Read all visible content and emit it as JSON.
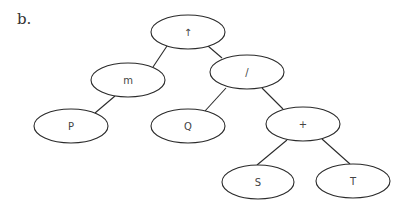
{
  "label": "b.",
  "colors": {
    "stroke": "#2a2a2a",
    "text": "#444444",
    "background": "#ffffff"
  },
  "tree": {
    "nodes": [
      {
        "id": "root",
        "label": "↑",
        "cx": 188,
        "cy": 32,
        "rx": 37,
        "ry": 17
      },
      {
        "id": "m",
        "label": "m",
        "cx": 128,
        "cy": 80,
        "rx": 37,
        "ry": 17
      },
      {
        "id": "div",
        "label": "/",
        "cx": 247,
        "cy": 72,
        "rx": 37,
        "ry": 17
      },
      {
        "id": "P",
        "label": "P",
        "cx": 71,
        "cy": 126,
        "rx": 37,
        "ry": 17
      },
      {
        "id": "Q",
        "label": "Q",
        "cx": 188,
        "cy": 126,
        "rx": 37,
        "ry": 17
      },
      {
        "id": "plus",
        "label": "+",
        "cx": 303,
        "cy": 124,
        "rx": 37,
        "ry": 17
      },
      {
        "id": "S",
        "label": "S",
        "cx": 258,
        "cy": 182,
        "rx": 36,
        "ry": 17
      },
      {
        "id": "T",
        "label": "T",
        "cx": 353,
        "cy": 181,
        "rx": 37,
        "ry": 17
      }
    ],
    "edges": [
      {
        "from": "root",
        "to": "m",
        "x1": 167,
        "y1": 46,
        "x2": 153,
        "y2": 67
      },
      {
        "from": "root",
        "to": "div",
        "x1": 208,
        "y1": 46,
        "x2": 222,
        "y2": 58
      },
      {
        "from": "m",
        "to": "P",
        "x1": 115,
        "y1": 96,
        "x2": 95,
        "y2": 113
      },
      {
        "from": "div",
        "to": "Q",
        "x1": 226,
        "y1": 88,
        "x2": 205,
        "y2": 111
      },
      {
        "from": "div",
        "to": "plus",
        "x1": 262,
        "y1": 88,
        "x2": 283,
        "y2": 109
      },
      {
        "from": "plus",
        "to": "S",
        "x1": 287,
        "y1": 140,
        "x2": 257,
        "y2": 165
      },
      {
        "from": "plus",
        "to": "T",
        "x1": 322,
        "y1": 139,
        "x2": 350,
        "y2": 164
      }
    ]
  }
}
